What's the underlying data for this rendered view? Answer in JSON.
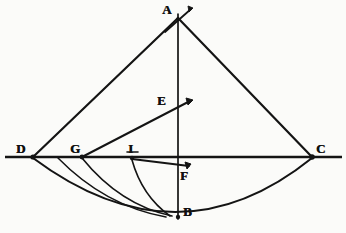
{
  "figure": {
    "ink_color": "#141414",
    "paper_color": "#fbfbf9",
    "width": 346,
    "height": 233
  },
  "labels": {
    "a": "A",
    "b": "B",
    "c": "C",
    "d": "D",
    "e": "E",
    "f": "F",
    "g": "G",
    "i": "I"
  },
  "points": {
    "A": {
      "x": 178,
      "y": 18,
      "label": "A",
      "label_x": 162,
      "label_y": 4
    },
    "B": {
      "x": 178,
      "y": 218,
      "label": "B",
      "label_x": 183,
      "label_y": 206
    },
    "C": {
      "x": 312,
      "y": 157,
      "label": "C",
      "label_x": 316,
      "label_y": 143
    },
    "D": {
      "x": 33,
      "y": 157,
      "label": "D",
      "label_x": 16,
      "label_y": 143
    },
    "E": {
      "x": 178,
      "y": 108,
      "label": "E",
      "label_x": 158,
      "label_y": 95
    },
    "F": {
      "x": 178,
      "y": 170,
      "label": "F",
      "label_x": 180,
      "label_y": 170
    },
    "G": {
      "x": 82,
      "y": 157,
      "label": "G",
      "label_x": 70,
      "label_y": 143
    },
    "I": {
      "x": 132,
      "y": 158,
      "label": "I",
      "label_x": 127,
      "label_y": 143
    }
  },
  "segments": [
    {
      "name": "baseline-horizontal",
      "x1": 5,
      "y1": 157,
      "x2": 342,
      "y2": 157
    },
    {
      "name": "axis-vertical",
      "x1": 178,
      "y1": 14,
      "x2": 178,
      "y2": 219
    },
    {
      "name": "leg-d-to-a",
      "x1": 33,
      "y1": 157,
      "x2": 178,
      "y2": 18
    },
    {
      "name": "leg-a-to-c",
      "x1": 178,
      "y1": 18,
      "x2": 312,
      "y2": 157
    },
    {
      "name": "ray-g-to-e",
      "x1": 82,
      "y1": 157,
      "x2": 190,
      "y2": 101
    },
    {
      "name": "ray-i-to-f",
      "x1": 132,
      "y1": 159,
      "x2": 189,
      "y2": 166
    },
    {
      "name": "tick-through-a",
      "x1": 165,
      "y1": 32,
      "x2": 191,
      "y2": 9
    }
  ],
  "arcs": [
    {
      "name": "arc-d-to-c-through-b",
      "d": "M 33 158 Q 178 266 312 158"
    },
    {
      "name": "arc-g-to-b",
      "d": "M 82 158 Q 120 205 172 216"
    },
    {
      "name": "arc-i-to-b",
      "d": "M 132 160 Q 142 196 170 216"
    },
    {
      "name": "arc-inner-short",
      "d": "M 58 158 Q 105 206 166 217"
    }
  ],
  "arrowheads": [
    {
      "name": "arrowhead-at-e-ray",
      "x": 190,
      "y": 101
    },
    {
      "name": "arrowhead-at-f-ray",
      "x": 189,
      "y": 166
    },
    {
      "name": "arrowhead-at-a-tick",
      "x": 191,
      "y": 9
    }
  ]
}
